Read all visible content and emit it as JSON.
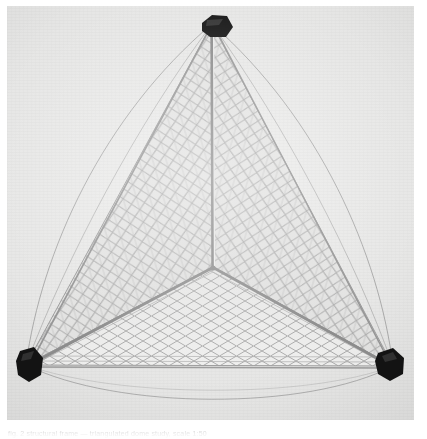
{
  "figure": {
    "plate_background": "#e6e6e5",
    "page_background": "#ffffff",
    "node_color": "#121212",
    "strut_color": "#9a9a9a",
    "mesh_color": "#a8a8a8",
    "arc_color": "#8c8c8c"
  },
  "caption": {
    "text": "fig. 2   structural frame — triangulated dome study, scale 1:50"
  },
  "structure": {
    "type": "tetrahedron",
    "face_count": 3,
    "visible_faces": [
      "left",
      "right",
      "base"
    ],
    "node_count": 4,
    "nodes": [
      {
        "name": "apex",
        "x": 212,
        "y": 24
      },
      {
        "name": "bottom-left",
        "x": 26,
        "y": 365
      },
      {
        "name": "bottom-right",
        "x": 393,
        "y": 366
      },
      {
        "name": "center",
        "x": 213,
        "y": 268
      }
    ],
    "struts": [
      {
        "name": "apex-to-center",
        "from": "apex",
        "to": "center"
      },
      {
        "name": "center-to-bottom-left",
        "from": "center",
        "to": "bottom-left"
      },
      {
        "name": "center-to-bottom-right",
        "from": "center",
        "to": "bottom-right"
      },
      {
        "name": "apex-to-bottom-left",
        "from": "apex",
        "to": "bottom-left"
      },
      {
        "name": "apex-to-bottom-right",
        "from": "apex",
        "to": "bottom-right"
      },
      {
        "name": "bottom-left-to-bottom-right",
        "from": "bottom-left",
        "to": "bottom-right"
      }
    ],
    "arcs": [
      {
        "name": "arc-left-outer",
        "spans": "apex to bottom-left"
      },
      {
        "name": "arc-left-inner",
        "spans": "apex to bottom-left"
      },
      {
        "name": "arc-right-outer",
        "spans": "apex to bottom-right"
      },
      {
        "name": "arc-right-inner",
        "spans": "apex to bottom-right"
      },
      {
        "name": "arc-base",
        "spans": "bottom-left to bottom-right"
      }
    ],
    "mesh": {
      "pattern": "diamond-lattice",
      "left_face_rows": 22,
      "right_face_rows": 22,
      "base_face_rows": 14
    }
  }
}
